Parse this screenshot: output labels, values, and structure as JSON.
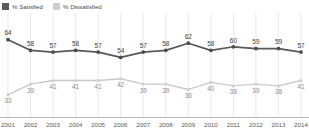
{
  "legend": {
    "position": "top-left",
    "items": [
      {
        "label": "% Satisfied",
        "color": "#58585a",
        "icon": "square-swatch"
      },
      {
        "label": "% Dissatisfied",
        "color": "#cecece",
        "icon": "square-swatch"
      }
    ]
  },
  "chart_data": {
    "type": "line",
    "title": "",
    "subtitle": "",
    "xlabel": "",
    "ylabel": "",
    "grid": true,
    "ylim": [
      25,
      70
    ],
    "categories": [
      "2001",
      "2002",
      "2003",
      "2004",
      "2005",
      "2006",
      "2007",
      "2008",
      "2009",
      "2010",
      "2011",
      "2012",
      "2013",
      "2014"
    ],
    "series": [
      {
        "name": "% Satisfied",
        "color": "#58585a",
        "values": [
          64,
          58,
          57,
          58,
          57,
          54,
          57,
          58,
          62,
          58,
          60,
          59,
          59,
          57
        ]
      },
      {
        "name": "% Dissatisfied",
        "color": "#cecece",
        "values": [
          33,
          39,
          41,
          41,
          41,
          42,
          39,
          39,
          36,
          40,
          38,
          39,
          38,
          41
        ]
      }
    ]
  }
}
